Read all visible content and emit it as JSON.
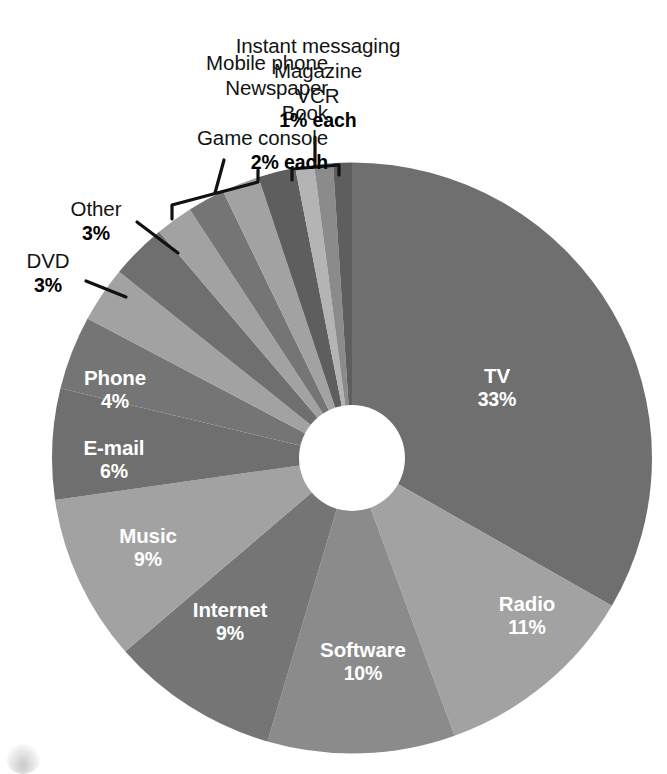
{
  "chart_data": {
    "type": "pie",
    "variant": "donut",
    "title": "",
    "subtitle": "",
    "xlabel": "",
    "ylabel": "",
    "legend_position": "none",
    "grid": false,
    "value_unit": "%",
    "total": 100,
    "categories": [
      "TV",
      "Radio",
      "Software",
      "Internet",
      "Music",
      "E-mail",
      "Phone",
      "DVD",
      "Other",
      "Game console",
      "Book",
      "Newspaper",
      "Mobile phone",
      "VCR",
      "Magazine",
      "Instant messaging"
    ],
    "values": [
      33,
      11,
      10,
      9,
      9,
      6,
      4,
      3,
      3,
      2,
      2,
      2,
      2,
      1,
      1,
      1
    ],
    "slices": [
      {
        "label": "TV",
        "value": 33,
        "display": "33%",
        "color": "#6f6f6f",
        "label_placement": "inside"
      },
      {
        "label": "Radio",
        "value": 11,
        "display": "11%",
        "color": "#a2a2a2",
        "label_placement": "inside"
      },
      {
        "label": "Software",
        "value": 10,
        "display": "10%",
        "color": "#8b8b8b",
        "label_placement": "inside"
      },
      {
        "label": "Internet",
        "value": 9,
        "display": "9%",
        "color": "#757575",
        "label_placement": "inside"
      },
      {
        "label": "Music",
        "value": 9,
        "display": "9%",
        "color": "#a2a2a2",
        "label_placement": "inside"
      },
      {
        "label": "E-mail",
        "value": 6,
        "display": "6%",
        "color": "#6f6f6f",
        "label_placement": "inside"
      },
      {
        "label": "Phone",
        "value": 4,
        "display": "4%",
        "color": "#757575",
        "label_placement": "inside"
      },
      {
        "label": "DVD",
        "value": 3,
        "display": "3%",
        "color": "#a2a2a2",
        "label_placement": "outside-leader"
      },
      {
        "label": "Other",
        "value": 3,
        "display": "3%",
        "color": "#6f6f6f",
        "label_placement": "outside-leader"
      },
      {
        "label": "Game console",
        "value": 2,
        "display": "2%",
        "color": "#a2a2a2",
        "label_placement": "bracket-2pct"
      },
      {
        "label": "Book",
        "value": 2,
        "display": "2%",
        "color": "#757575",
        "label_placement": "bracket-2pct"
      },
      {
        "label": "Newspaper",
        "value": 2,
        "display": "2%",
        "color": "#a2a2a2",
        "label_placement": "bracket-2pct"
      },
      {
        "label": "Mobile phone",
        "value": 2,
        "display": "2%",
        "color": "#5e5e5e",
        "label_placement": "bracket-2pct"
      },
      {
        "label": "VCR",
        "value": 1,
        "display": "1%",
        "color": "#b4b4b4",
        "label_placement": "bracket-1pct"
      },
      {
        "label": "Magazine",
        "value": 1,
        "display": "1%",
        "color": "#8b8b8b",
        "label_placement": "bracket-1pct"
      },
      {
        "label": "Instant messaging",
        "value": 1,
        "display": "1%",
        "color": "#5e5e5e",
        "label_placement": "bracket-1pct"
      }
    ]
  },
  "labels": {
    "group_2pct": {
      "names": [
        "Mobile phone",
        "Newspaper",
        "Book",
        "Game console"
      ],
      "percent": "2% each"
    },
    "group_1pct": {
      "names": [
        "Instant messaging",
        "Magazine",
        "VCR"
      ],
      "percent": "1% each"
    },
    "other": {
      "name": "Other",
      "percent": "3%"
    },
    "dvd": {
      "name": "DVD",
      "percent": "3%"
    },
    "tv": {
      "name": "TV",
      "percent": "33%"
    },
    "radio": {
      "name": "Radio",
      "percent": "11%"
    },
    "software": {
      "name": "Software",
      "percent": "10%"
    },
    "internet": {
      "name": "Internet",
      "percent": "9%"
    },
    "music": {
      "name": "Music",
      "percent": "9%"
    },
    "email": {
      "name": "E-mail",
      "percent": "6%"
    },
    "phone": {
      "name": "Phone",
      "percent": "4%"
    }
  },
  "geometry": {
    "cx": 352,
    "cy": 458,
    "outer_r": 300,
    "inner_r": 53,
    "start_angle_deg": 0
  },
  "colors": {
    "background": "#ffffff",
    "label_text": "#131313",
    "inside_label_text": "#ffffff",
    "leader_line": "#111111",
    "dark_gray": "#6f6f6f",
    "mid_gray": "#8b8b8b",
    "light_gray": "#a2a2a2",
    "very_dark_gray": "#5e5e5e",
    "very_light_gray": "#b4b4b4"
  }
}
